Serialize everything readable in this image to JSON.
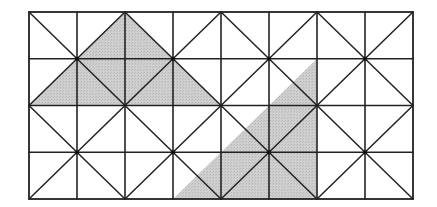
{
  "diagram": {
    "type": "triangulated-square-grid",
    "columns": 8,
    "rows": 4,
    "pattern": "each 2x2 block divided by diagonals meeting at its center vertex",
    "colors": {
      "line": "#222222",
      "shade": "#c8c8c8",
      "background": "#ffffff"
    },
    "shaded_regions": [
      {
        "name": "upper-left-triangle",
        "vertices_grid": [
          [
            0,
            2
          ],
          [
            2,
            0
          ],
          [
            4,
            2
          ]
        ]
      },
      {
        "name": "lower-right-triangle",
        "vertices_grid": [
          [
            3,
            4
          ],
          [
            6,
            1
          ],
          [
            6,
            4
          ]
        ]
      }
    ]
  }
}
